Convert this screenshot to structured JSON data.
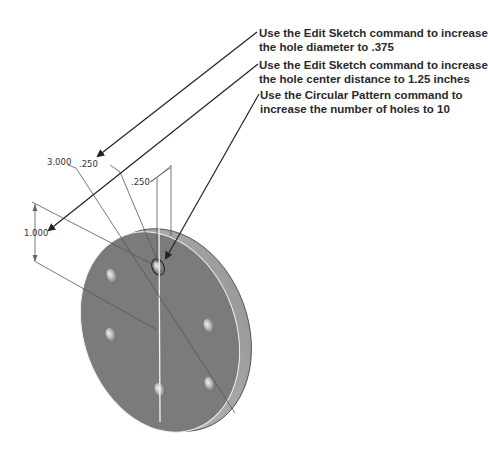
{
  "callouts": [
    {
      "line1": "Use the Edit Sketch command to increase",
      "line2": "the hole diameter to .375"
    },
    {
      "line1": "Use the Edit Sketch command to increase",
      "line2": "the hole center distance to 1.25 inches"
    },
    {
      "line1": "Use the Circular Pattern command to",
      "line2": "increase the number of holes to 10"
    }
  ],
  "dimensions": {
    "diameter": "3.000",
    "hole_diameter": ".250",
    "thickness": ".250",
    "center_distance": "1.000"
  },
  "model": {
    "face_color": "#7b7b7b",
    "rim_color": "#b8b8b8",
    "hole_count": 6
  }
}
